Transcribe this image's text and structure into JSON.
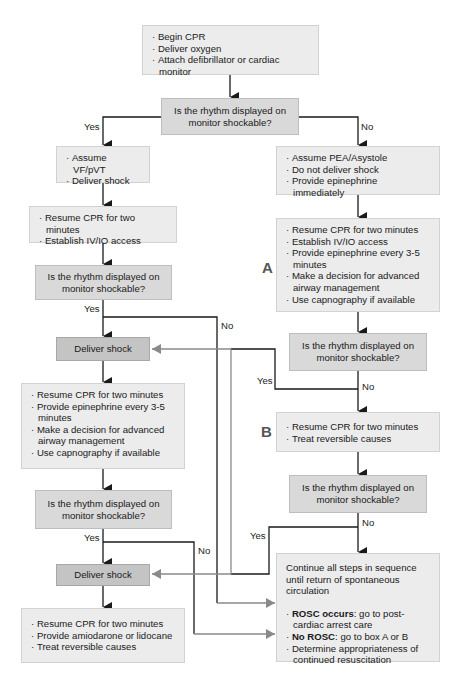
{
  "diagram": {
    "type": "flowchart",
    "start": {
      "items": [
        "Begin CPR",
        "Deliver oxygen",
        "Attach defibrillator or cardiac monitor"
      ]
    },
    "decision_label": "Is the rhythm displayed on monitor shockable?",
    "decision_line1": "Is the rhythm displayed on",
    "decision_line2": "monitor shockable?",
    "yes": "Yes",
    "no": "No",
    "left": {
      "vf": {
        "items": [
          "Assume VF/pVT",
          "Deliver shock"
        ]
      },
      "resume1": {
        "items": [
          "Resume CPR for two minutes",
          "Establish IV/IO access"
        ]
      },
      "shock1": "Deliver shock",
      "resume2": {
        "items": [
          "Resume CPR for two minutes",
          "Provide epinephrine every 3-5 minutes",
          "Make a decision for advanced airway management",
          "Use capnography if available"
        ]
      },
      "shock2": "Deliver shock",
      "final": {
        "items": [
          "Resume CPR for two minutes",
          "Provide amiodarone or lidocane",
          "Treat reversible causes"
        ]
      }
    },
    "right": {
      "pea": {
        "items": [
          "Assume PEA/Asystole",
          "Do not deliver shock",
          "Provide epinephrine immediately"
        ]
      },
      "box_a": {
        "label": "A",
        "items": [
          "Resume CPR for two minutes",
          "Establish IV/IO access",
          "Provide epinephrine every 3-5 minutes",
          "Make a decision for advanced airway management",
          "Use capnography if available"
        ]
      },
      "box_b": {
        "label": "B",
        "items": [
          "Resume CPR for two minutes",
          "Treat reversible causes"
        ]
      },
      "final": {
        "intro": "Continue all steps in sequence until return of spontaneous circulation",
        "rosc_bold": "ROSC occurs",
        "rosc_rest": ": go to post-cardiac arrest care",
        "norosc_bold": "No ROSC",
        "norosc_rest": ": go to box A or B",
        "determine": "Determine appropriateness of continued resuscitation"
      }
    },
    "colors": {
      "box_fill": "#ececec",
      "decision_fill": "#d9d9d9",
      "shock_fill": "#c4c4c4",
      "line_dark": "#1a1a1a",
      "line_gray": "#8a8a8a"
    }
  }
}
